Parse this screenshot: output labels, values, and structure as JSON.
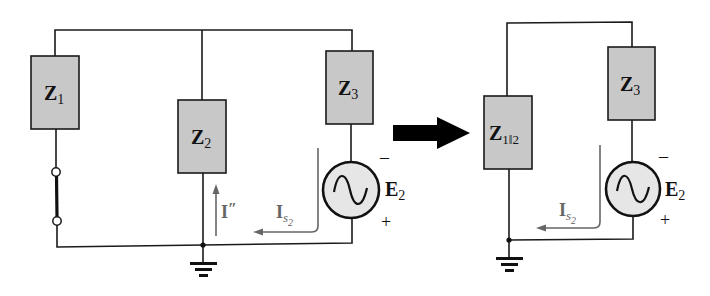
{
  "colors": {
    "impedance_fill": "#c8c8c8",
    "source_fill": "#e6e6e6",
    "wire": "#1a1a1a",
    "current_arrow": "#666666",
    "transform_arrow": "#000000"
  },
  "left_circuit": {
    "z1": {
      "main": "Z",
      "sub": "1"
    },
    "z2": {
      "main": "Z",
      "sub": "2"
    },
    "z3": {
      "main": "Z",
      "sub": "3"
    },
    "source": {
      "main": "E",
      "sub": "2",
      "minus": "–",
      "plus": "+"
    },
    "current_branch": {
      "main": "I",
      "prime": "″"
    },
    "current_source": {
      "main": "I",
      "sub": "s",
      "subsub": "2"
    },
    "short_circuit": "short"
  },
  "transform_arrow": "right-arrow",
  "right_circuit": {
    "z12": {
      "main": "Z",
      "sub": "1‖2"
    },
    "z3": {
      "main": "Z",
      "sub": "3"
    },
    "source": {
      "main": "E",
      "sub": "2",
      "minus": "–",
      "plus": "+"
    },
    "current_source": {
      "main": "I",
      "sub": "s",
      "subsub": "2"
    }
  }
}
